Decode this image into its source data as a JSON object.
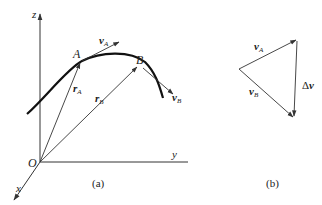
{
  "figure_a": {
    "caption": "(a)",
    "axes": {
      "z": "z",
      "y": "y",
      "x": "x",
      "origin": "O"
    },
    "points": {
      "A": "A",
      "B": "B"
    },
    "vectors": {
      "vA": {
        "main": "v",
        "sub": "A"
      },
      "vB": {
        "main": "v",
        "sub": "B"
      },
      "rA": {
        "main": "r",
        "sub": "A"
      },
      "rB": {
        "main": "r",
        "sub": "B"
      }
    }
  },
  "figure_b": {
    "caption": "(b)",
    "vectors": {
      "vA": {
        "main": "v",
        "sub": "A"
      },
      "vB": {
        "main": "v",
        "sub": "B"
      },
      "dv": {
        "prefix": "Δ",
        "main": "v"
      }
    }
  },
  "colors": {
    "line": "#333333",
    "curve": "#111111",
    "background": "#ffffff"
  }
}
